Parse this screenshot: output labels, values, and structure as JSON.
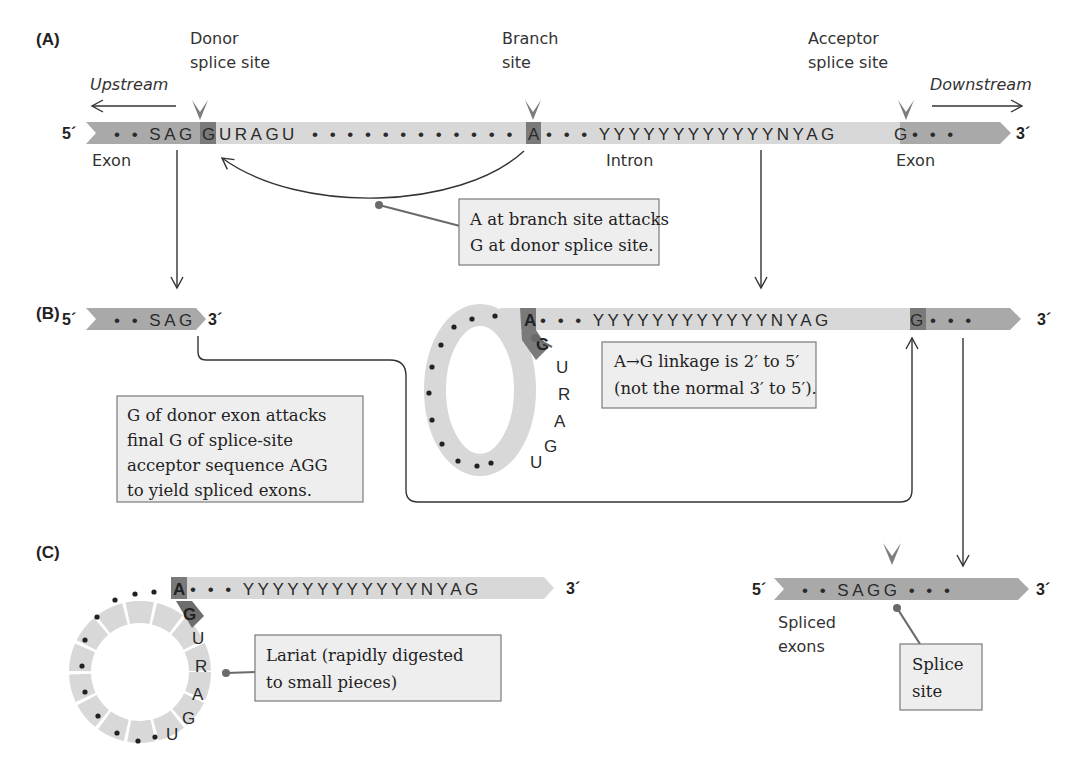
{
  "panels": {
    "a": {
      "label": "(A)",
      "five_prime": "5´",
      "three_prime": "3´",
      "upstream": "Upstream",
      "downstream": "Downstream",
      "donor_label_1": "Donor",
      "donor_label_2": "splice site",
      "branch_label_1": "Branch",
      "branch_label_2": "site",
      "acceptor_label_1": "Acceptor",
      "acceptor_label_2": "splice site",
      "exon_left_seq": "• • SAG",
      "donor_g": "G",
      "intron_start_seq": "URAGU",
      "intron_dots": "• • • • • • • • • • • •",
      "branch_a": "A",
      "intron_end_seq": "• • • YYYYYYYYYYYYNYAG",
      "acceptor_g": "G",
      "exon_right_seq": "• • •",
      "exon_left_label": "Exon",
      "intron_label": "Intron",
      "exon_right_label": "Exon",
      "callout_line_1": "A at branch site attacks",
      "callout_line_2": "G at donor splice site."
    },
    "b": {
      "label": "(B)",
      "five_prime": "5´",
      "three_prime": "3´",
      "exon_seq": "• • SAG",
      "lariat_a": "A",
      "lariat_g": "G",
      "lariat_letters": [
        "U",
        "R",
        "A",
        "G",
        "U"
      ],
      "intron_seq": "• • • YYYYYYYYYYYYNYAG",
      "acceptor_g": "G",
      "exon_right_seq": "• • •",
      "linkage_line_1": "A→G linkage is 2′ to 5′",
      "linkage_line_2": "(not the normal 3′ to 5′).",
      "attack_line_1": "G of donor exon attacks",
      "attack_line_2": "final G of splice-site",
      "attack_line_3": "acceptor sequence AGG",
      "attack_line_4": "to yield spliced exons."
    },
    "c": {
      "label": "(C)",
      "three_prime": "3´",
      "lariat_a": "A",
      "lariat_g": "G",
      "lariat_letters": [
        "U",
        "R",
        "A",
        "G",
        "U"
      ],
      "intron_seq": "• • • YYYYYYYYYYYYNYAG",
      "lariat_line_1": "Lariat (rapidly digested",
      "lariat_line_2": "to small pieces)",
      "spliced_five_prime": "5´",
      "spliced_three_prime": "3´",
      "spliced_seq": "• • SAGG • • •",
      "spliced_label_1": "Spliced",
      "spliced_label_2": "exons",
      "splice_site_line_1": "Splice",
      "splice_site_line_2": "site"
    }
  },
  "colors": {
    "exon": "#a9a9a9",
    "intron": "#d8d8d8",
    "highlight": "#7a7a7a",
    "callout_fill": "#eeeeee",
    "callout_stroke": "#7a7a7a"
  }
}
